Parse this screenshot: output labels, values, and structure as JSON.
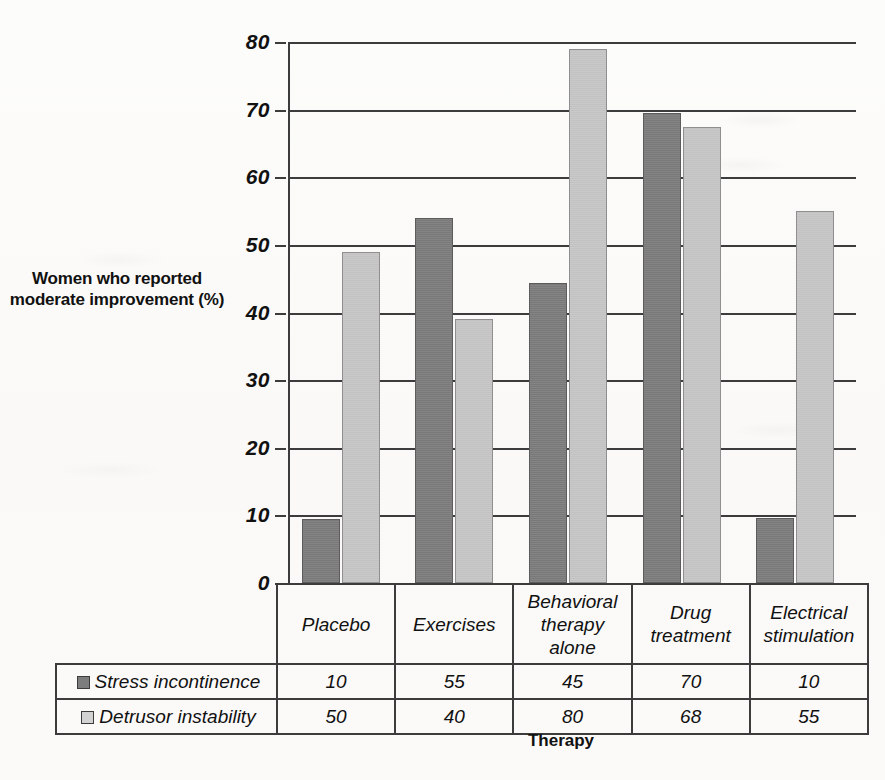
{
  "chart_data": {
    "type": "bar",
    "title": "",
    "xlabel": "Therapy",
    "ylabel": "Women who reported moderate improvement (%)",
    "ylim": [
      0,
      80
    ],
    "yticks": [
      0,
      10,
      20,
      30,
      40,
      50,
      60,
      70,
      80
    ],
    "grid": true,
    "legend_position": "data-table-row-labels",
    "categories": [
      "Placebo",
      "Exercises",
      "Behavioral therapy alone",
      "Drug treatment",
      "Electrical stimulation"
    ],
    "category_lines": [
      [
        "Placebo"
      ],
      [
        "Exercises"
      ],
      [
        "Behavioral",
        "therapy",
        "alone"
      ],
      [
        "Drug",
        "treatment"
      ],
      [
        "Electrical",
        "stimulation"
      ]
    ],
    "series": [
      {
        "name": "Stress incontinence",
        "color": "#7d7d7d",
        "values": [
          10,
          55,
          45,
          70,
          10
        ],
        "plotted_values": [
          9.4,
          54,
          44.3,
          69.5,
          9.6
        ]
      },
      {
        "name": "Detrusor instability",
        "color": "#c6c6c6",
        "values": [
          50,
          40,
          80,
          68,
          55
        ],
        "plotted_values": [
          49,
          39,
          79,
          67.4,
          55
        ]
      }
    ]
  },
  "axis": {
    "y_title": "Women who reported moderate improvement (%)",
    "x_title": "Therapy",
    "tick_labels": [
      "80",
      "70",
      "60",
      "50",
      "40",
      "30",
      "20",
      "10",
      "0"
    ]
  },
  "table": {
    "corner_label": "",
    "column_headers": [
      "Placebo",
      "Exercises",
      "Behavioral therapy alone",
      "Drug treatment",
      "Electrical stimulation"
    ],
    "rows": [
      {
        "label": "Stress incontinence",
        "swatch": "dark-gray-square",
        "cells": [
          "10",
          "55",
          "45",
          "70",
          "10"
        ]
      },
      {
        "label": "Detrusor instability",
        "swatch": "light-gray-square",
        "cells": [
          "50",
          "40",
          "80",
          "68",
          "55"
        ]
      }
    ]
  },
  "colors": {
    "series_stress_incontinence": "#7d7d7d",
    "series_detrusor_instability": "#c6c6c6",
    "axis_line": "#3c3c3c",
    "page_background": "#fbfbfa"
  }
}
